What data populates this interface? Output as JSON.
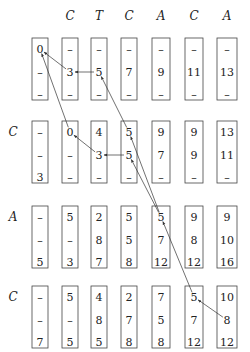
{
  "diagram": {
    "type": "dynamic-programming-alignment-grid",
    "column_headers": [
      "",
      "C",
      "T",
      "C",
      "A",
      "C",
      "A"
    ],
    "row_labels": [
      "",
      "C",
      "A",
      "C"
    ],
    "gap_symbol": "–",
    "cells": [
      [
        [
          "0",
          "–",
          "–"
        ],
        [
          "–",
          "3",
          "–"
        ],
        [
          "–",
          "5",
          "–"
        ],
        [
          "–",
          "7",
          "–"
        ],
        [
          "–",
          "9",
          "–"
        ],
        [
          "–",
          "11",
          "–"
        ],
        [
          "–",
          "13",
          "–"
        ]
      ],
      [
        [
          "–",
          "–",
          "3"
        ],
        [
          "0",
          "–",
          "–"
        ],
        [
          "4",
          "3",
          "–"
        ],
        [
          "5",
          "5",
          "–"
        ],
        [
          "9",
          "7",
          "–"
        ],
        [
          "9",
          "9",
          "–"
        ],
        [
          "13",
          "11",
          "–"
        ]
      ],
      [
        [
          "–",
          "–",
          "5"
        ],
        [
          "5",
          "–",
          "3"
        ],
        [
          "2",
          "8",
          "7"
        ],
        [
          "5",
          "5",
          "8"
        ],
        [
          "5",
          "7",
          "12"
        ],
        [
          "9",
          "8",
          "12"
        ],
        [
          "9",
          "10",
          "16"
        ]
      ],
      [
        [
          "–",
          "–",
          "7"
        ],
        [
          "5",
          "–",
          "5"
        ],
        [
          "4",
          "8",
          "5"
        ],
        [
          "2",
          "7",
          "8"
        ],
        [
          "7",
          "5",
          "8"
        ],
        [
          "5",
          "7",
          "12"
        ],
        [
          "10",
          "8",
          "12"
        ]
      ]
    ],
    "traceback_arrows": [
      {
        "from": {
          "row": 0,
          "col": 1,
          "slot": 1
        },
        "to": {
          "row": 0,
          "col": 0,
          "slot": 0
        }
      },
      {
        "from": {
          "row": 0,
          "col": 2,
          "slot": 1
        },
        "to": {
          "row": 0,
          "col": 1,
          "slot": 1
        }
      },
      {
        "from": {
          "row": 1,
          "col": 1,
          "slot": 0
        },
        "to": {
          "row": 0,
          "col": 0,
          "slot": 0
        }
      },
      {
        "from": {
          "row": 1,
          "col": 2,
          "slot": 1
        },
        "to": {
          "row": 1,
          "col": 1,
          "slot": 0
        }
      },
      {
        "from": {
          "row": 1,
          "col": 3,
          "slot": 1
        },
        "to": {
          "row": 1,
          "col": 2,
          "slot": 1
        }
      },
      {
        "from": {
          "row": 1,
          "col": 3,
          "slot": 0
        },
        "to": {
          "row": 0,
          "col": 2,
          "slot": 1
        }
      },
      {
        "from": {
          "row": 2,
          "col": 4,
          "slot": 0
        },
        "to": {
          "row": 1,
          "col": 3,
          "slot": 0
        }
      },
      {
        "from": {
          "row": 2,
          "col": 4,
          "slot": 0
        },
        "to": {
          "row": 1,
          "col": 3,
          "slot": 1
        }
      },
      {
        "from": {
          "row": 3,
          "col": 5,
          "slot": 0
        },
        "to": {
          "row": 2,
          "col": 4,
          "slot": 0
        }
      },
      {
        "from": {
          "row": 3,
          "col": 6,
          "slot": 1
        },
        "to": {
          "row": 3,
          "col": 5,
          "slot": 0
        }
      }
    ]
  }
}
